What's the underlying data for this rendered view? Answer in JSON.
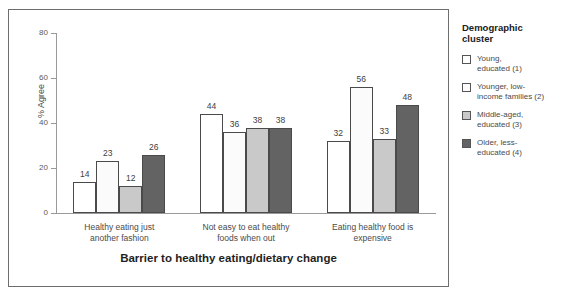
{
  "chart_data": {
    "type": "bar",
    "title": "",
    "xlabel": "Barrier to healthy eating/dietary change",
    "ylabel": "% Agree",
    "ylim": [
      0,
      80
    ],
    "yticks": [
      0,
      20,
      40,
      60,
      80
    ],
    "grid": false,
    "legend_position": "right-outside",
    "legend_title": "Demographic cluster",
    "categories": [
      "Healthy eating just\nanother fashion",
      "Not easy to eat healthy\nfoods when out",
      "Eating healthy food is\nexpensive"
    ],
    "series": [
      {
        "name": "Young, educated (1)",
        "color": "#ffffff",
        "values": [
          14,
          44,
          32
        ]
      },
      {
        "name": "Younger, low-income families (2)",
        "color": "#fbfbfb",
        "values": [
          23,
          36,
          56
        ]
      },
      {
        "name": "Middle-aged, educated (3)",
        "color": "#c9c9c9",
        "values": [
          12,
          38,
          33
        ]
      },
      {
        "name": "Older, less-educated (4)",
        "color": "#636363",
        "values": [
          26,
          38,
          48
        ]
      }
    ]
  },
  "legend": {
    "title": "Demographic\ncluster",
    "items": [
      {
        "label": "Young,\neducated (1)",
        "color": "#ffffff"
      },
      {
        "label": "Younger, low-\nincome families (2)",
        "color": "#fbfbfb"
      },
      {
        "label": "Middle-aged,\neducated (3)",
        "color": "#c9c9c9"
      },
      {
        "label": "Older, less-\neducated (4)",
        "color": "#636363"
      }
    ]
  }
}
